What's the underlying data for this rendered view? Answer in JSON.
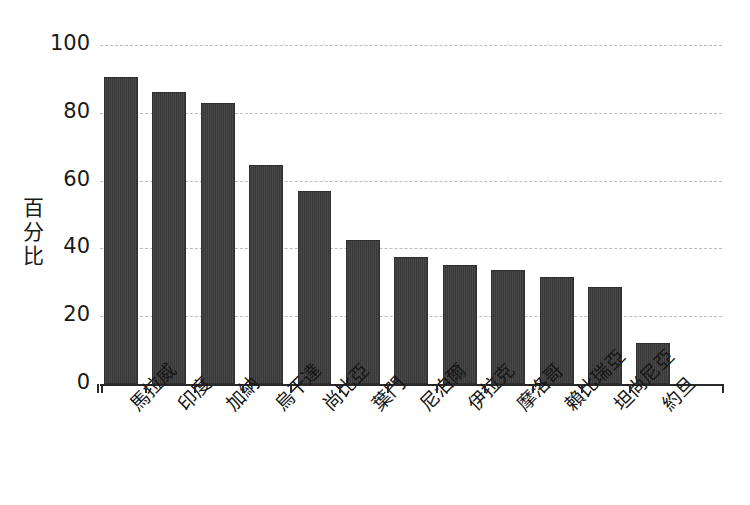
{
  "chart_data": {
    "type": "bar",
    "title": "",
    "title_clipped": true,
    "xlabel": "",
    "ylabel": "百分比",
    "categories": [
      "馬拉威",
      "印度",
      "加納",
      "烏干達",
      "尚比亞",
      "葉門",
      "尼泊爾",
      "伊拉克",
      "摩洛哥",
      "賴比瑞亞",
      "坦尚尼亞",
      "約旦"
    ],
    "values": [
      90.5,
      86,
      83,
      64.5,
      57,
      42.5,
      37.5,
      35,
      33.5,
      31.5,
      28.5,
      12
    ],
    "ylim": [
      0,
      100
    ],
    "ytick_labels": [
      "100",
      "80",
      "60",
      "40",
      "20",
      "0"
    ],
    "ytick_values": [
      100,
      80,
      60,
      40,
      20,
      0
    ],
    "grid": true,
    "grid_axis": "y",
    "grid_style": "dashed",
    "legend": null,
    "bar_color": "#3b3b3b",
    "grid_color": "#bdbdbd",
    "axis_color": "#2a2a2a",
    "background_color": "#ffffff"
  }
}
